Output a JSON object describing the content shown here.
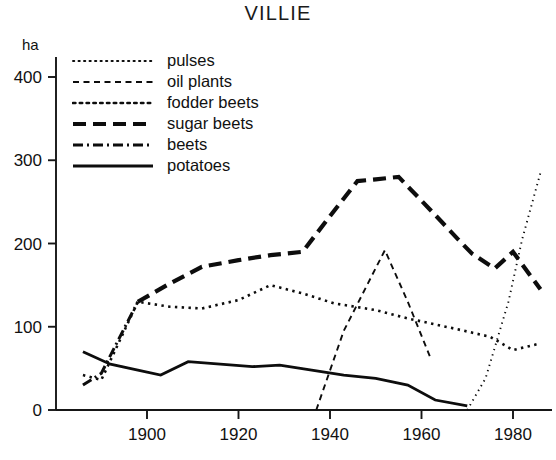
{
  "chart_data": {
    "type": "line",
    "title": "VILLIE",
    "xlabel": "",
    "ylabel": "ha",
    "ylim": [
      0,
      430
    ],
    "xlim": [
      1884,
      1988
    ],
    "grid": false,
    "legend_position": "upper-left",
    "y_ticks": [
      0,
      100,
      200,
      300,
      400
    ],
    "y_tick_labels": [
      "0",
      "100",
      "200",
      "300",
      "400"
    ],
    "x_ticks": [
      1900,
      1920,
      1940,
      1960,
      1980
    ],
    "x_tick_labels": [
      "1900",
      "1920",
      "1940",
      "1960",
      "1980"
    ],
    "series": [
      {
        "name": "pulses",
        "style": "fine-dotted",
        "x": [
          1970,
          1974,
          1979,
          1982,
          1986
        ],
        "values": [
          0,
          38,
          130,
          205,
          285
        ]
      },
      {
        "name": "oil plants",
        "style": "dashed",
        "x": [
          1937,
          1943,
          1952,
          1957,
          1962
        ],
        "values": [
          0,
          95,
          192,
          130,
          62
        ]
      },
      {
        "name": "fodder beets",
        "style": "dotted",
        "x": [
          1886,
          1890,
          1898,
          1905,
          1912,
          1920,
          1927,
          1934,
          1941,
          1950,
          1957,
          1962,
          1967,
          1971,
          1975,
          1980,
          1986
        ],
        "values": [
          42,
          36,
          130,
          124,
          122,
          132,
          150,
          140,
          128,
          120,
          110,
          104,
          98,
          93,
          88,
          72,
          80
        ]
      },
      {
        "name": "sugar beets",
        "style": "long-dashed",
        "x": [
          1898,
          1905,
          1912,
          1920,
          1927,
          1934,
          1941,
          1946,
          1950,
          1955,
          1962,
          1968,
          1971,
          1976,
          1980,
          1986
        ],
        "values": [
          130,
          152,
          172,
          180,
          186,
          190,
          240,
          275,
          277,
          280,
          240,
          205,
          188,
          170,
          190,
          145
        ]
      },
      {
        "name": "beets",
        "style": "dash-dotted",
        "x": [
          1886,
          1890,
          1898
        ],
        "values": [
          30,
          44,
          130
        ]
      },
      {
        "name": "potatoes",
        "style": "solid",
        "x": [
          1886,
          1892,
          1898,
          1903,
          1909,
          1916,
          1923,
          1929,
          1936,
          1943,
          1950,
          1957,
          1963,
          1970
        ],
        "values": [
          70,
          55,
          48,
          42,
          58,
          55,
          52,
          54,
          48,
          42,
          38,
          30,
          12,
          5
        ]
      }
    ]
  },
  "legend": {
    "items": [
      {
        "label": "pulses",
        "style": "fine-dotted"
      },
      {
        "label": "oil plants",
        "style": "dashed"
      },
      {
        "label": "fodder beets",
        "style": "dotted"
      },
      {
        "label": "sugar beets",
        "style": "long-dashed"
      },
      {
        "label": "beets",
        "style": "dash-dotted"
      },
      {
        "label": "potatoes",
        "style": "solid"
      }
    ]
  }
}
